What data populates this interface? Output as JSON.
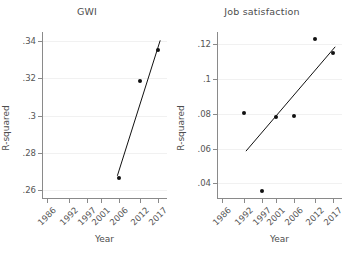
{
  "chart_data": [
    {
      "type": "scatter",
      "title": "GWI",
      "xlabel": "Year",
      "ylabel": "R-squared",
      "xlim": [
        1984.5,
        2019.5
      ],
      "ylim": [
        0.255,
        0.345
      ],
      "xticks": [
        1986,
        1992,
        1997,
        2001,
        2006,
        2012,
        2017
      ],
      "yticks": [
        0.26,
        0.28,
        0.3,
        0.32,
        0.34
      ],
      "ytick_labels": [
        ".26",
        ".28",
        ".3",
        ".32",
        ".34"
      ],
      "grid": true,
      "legend": "none",
      "points": [
        {
          "x": 2006,
          "y": 0.2665
        },
        {
          "x": 2012,
          "y": 0.3185
        },
        {
          "x": 2017,
          "y": 0.3355
        }
      ],
      "series": [
        {
          "name": "fit-line",
          "type": "line",
          "x": [
            2005.6,
            2017.6
          ],
          "y": [
            0.2675,
            0.3405
          ]
        }
      ]
    },
    {
      "type": "scatter",
      "title": "Job satisfaction",
      "xlabel": "Year",
      "ylabel": "R-squared",
      "xlim": [
        1984.5,
        2019.5
      ],
      "ylim": [
        0.031,
        0.127
      ],
      "xticks": [
        1986,
        1992,
        1997,
        2001,
        2006,
        2012,
        2017
      ],
      "yticks": [
        0.04,
        0.06,
        0.08,
        0.1,
        0.12
      ],
      "ytick_labels": [
        ".04",
        ".06",
        ".08",
        ".1",
        ".12"
      ],
      "grid": true,
      "legend": "none",
      "points": [
        {
          "x": 1992,
          "y": 0.0807
        },
        {
          "x": 1997,
          "y": 0.0358
        },
        {
          "x": 2001,
          "y": 0.0781
        },
        {
          "x": 2006,
          "y": 0.0787
        },
        {
          "x": 2012,
          "y": 0.1232
        },
        {
          "x": 2017,
          "y": 0.1152
        }
      ],
      "series": [
        {
          "name": "fit-line",
          "type": "line",
          "x": [
            1992.6,
            2017.6
          ],
          "y": [
            0.0585,
            0.1185
          ]
        }
      ]
    }
  ],
  "panels": [
    {
      "title": "GWI",
      "ylabel": "R-squared",
      "xlabel": "Year",
      "ytick_labels": [
        ".26",
        ".28",
        ".3",
        ".32",
        ".34"
      ],
      "xtick_labels": [
        "1986",
        "1992",
        "1997",
        "2001",
        "2006",
        "2012",
        "2017"
      ]
    },
    {
      "title": "Job satisfaction",
      "ylabel": "R-squared",
      "xlabel": "Year",
      "ytick_labels": [
        ".04",
        ".06",
        ".08",
        ".1",
        ".12"
      ],
      "xtick_labels": [
        "1986",
        "1992",
        "1997",
        "2001",
        "2006",
        "2012",
        "2017"
      ]
    }
  ],
  "colors": {
    "marker": "#111111",
    "axis": "#8a8a8a",
    "grid": "#f1f1f1",
    "text": "#555555",
    "background": "#ffffff"
  }
}
